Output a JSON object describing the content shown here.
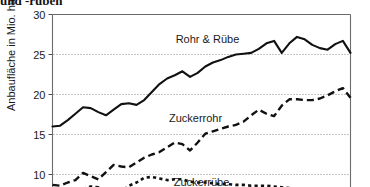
{
  "figure": {
    "title_fragment": "und -rüben",
    "y_axis_title": "Anbaufläche in Mio. ha"
  },
  "chart_data": {
    "type": "line",
    "title": "und -rüben",
    "xlabel": "",
    "ylabel": "Anbaufläche in Mio. ha",
    "ylim": [
      8.2,
      30
    ],
    "yticks": [
      10,
      15,
      20,
      25,
      30
    ],
    "ytick_labels": [
      "10",
      "15",
      "20",
      "25",
      "30"
    ],
    "grid": "horizontal-dotted",
    "legend": "inline-labels",
    "x": [
      0,
      1,
      2,
      3,
      4,
      5,
      6,
      7,
      8,
      9,
      10,
      11,
      12,
      13,
      14,
      15,
      16,
      17,
      18,
      19,
      20,
      21,
      22,
      23,
      24,
      25,
      26,
      27,
      28,
      29,
      30,
      31,
      32,
      33,
      34,
      35,
      36,
      37,
      38,
      39
    ],
    "series": [
      {
        "name": "Rohr & Rübe",
        "style": "solid",
        "label_x": 0.52,
        "label_y": 26.4,
        "values": [
          16.0,
          16.1,
          16.8,
          17.6,
          18.4,
          18.3,
          17.8,
          17.4,
          18.1,
          18.8,
          18.9,
          18.7,
          19.3,
          20.3,
          21.3,
          22.0,
          22.4,
          22.9,
          22.2,
          22.7,
          23.5,
          24.0,
          24.3,
          24.7,
          25.0,
          25.1,
          25.2,
          25.7,
          26.4,
          26.7,
          25.2,
          26.4,
          27.2,
          26.9,
          26.2,
          25.8,
          25.6,
          26.3,
          26.7,
          25.2
        ]
      },
      {
        "name": "Zuckerrohr",
        "style": "dashed",
        "label_x": 0.48,
        "label_y": 16.6,
        "values": [
          8.7,
          8.6,
          9.0,
          9.3,
          10.2,
          9.8,
          9.4,
          10.3,
          11.2,
          11.0,
          10.9,
          11.5,
          12.1,
          12.5,
          12.8,
          13.4,
          14.0,
          13.8,
          13.0,
          14.0,
          15.1,
          15.4,
          15.7,
          16.0,
          16.2,
          16.6,
          17.4,
          18.1,
          17.6,
          17.3,
          18.6,
          19.4,
          19.4,
          19.3,
          19.3,
          19.5,
          19.9,
          20.4,
          20.8,
          19.6
        ]
      },
      {
        "name": "Zuckerrübe",
        "style": "dotted",
        "label_x": 0.5,
        "label_y": 8.6,
        "values": [
          7.3,
          7.5,
          7.8,
          8.3,
          8.2,
          8.5,
          8.4,
          7.1,
          6.9,
          7.8,
          8.6,
          9.0,
          9.6,
          9.7,
          9.5,
          9.3,
          9.4,
          9.4,
          9.1,
          9.0,
          9.0,
          8.9,
          8.8,
          8.8,
          8.7,
          8.7,
          8.6,
          8.6,
          8.6,
          8.5,
          8.4,
          8.3,
          8.2,
          8.1,
          7.9,
          7.6,
          7.2,
          6.6,
          6.0,
          5.6
        ]
      }
    ]
  }
}
